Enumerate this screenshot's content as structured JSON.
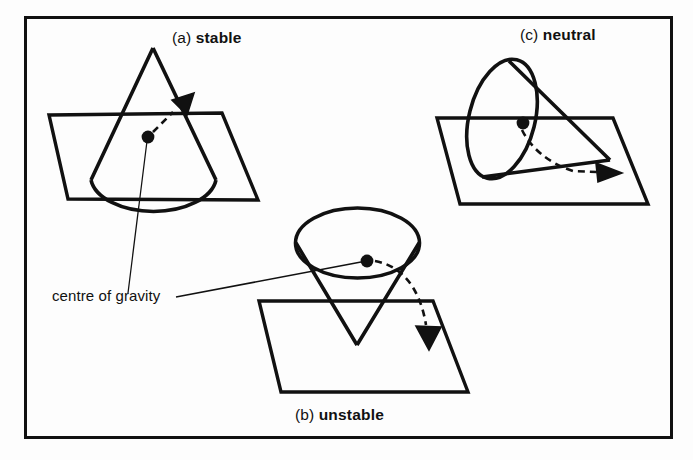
{
  "figure": {
    "kind": "line-diagram",
    "background_color": "#fdfdfd",
    "ink_color": "#111111",
    "frame": {
      "name": "figure-border",
      "x": 25,
      "y": 17,
      "width": 647,
      "height": 421,
      "stroke_width": 3
    },
    "panels": [
      {
        "id": "a",
        "tag": "(a)",
        "name": "stable",
        "label_x": 172,
        "label_y": 30,
        "description": "cone resting on its circular base, apex upward",
        "arrow_direction": "up-right"
      },
      {
        "id": "b",
        "tag": "(b)",
        "name": "unstable",
        "label_x": 295,
        "label_y": 407,
        "description": "cone balanced on its apex, base upward",
        "arrow_direction": "down"
      },
      {
        "id": "c",
        "tag": "(c)",
        "name": "neutral",
        "label_x": 520,
        "label_y": 27,
        "description": "cone lying on its side on the plane",
        "arrow_direction": "right"
      }
    ],
    "annotation": {
      "text": "centre of gravity",
      "x": 52,
      "y": 287,
      "points_to": [
        "stable-cone-cog-dot",
        "unstable-cone-cog-dot"
      ]
    },
    "cog_dots": [
      {
        "panel": "a",
        "cx": 148,
        "cy": 137,
        "r": 6.2
      },
      {
        "panel": "b",
        "cx": 367,
        "cy": 261,
        "r": 6.2
      },
      {
        "panel": "c",
        "cx": 523,
        "cy": 123,
        "r": 6.2
      }
    ]
  }
}
